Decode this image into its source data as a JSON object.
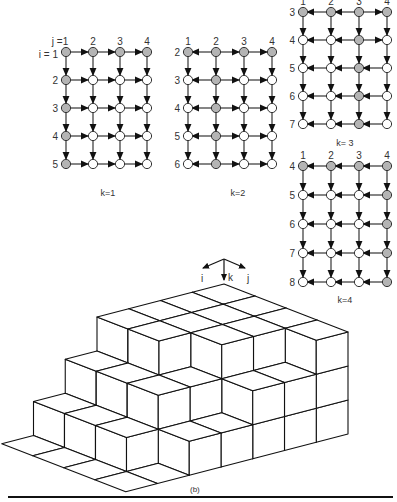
{
  "figure_label": "(b)",
  "axes_glyph": {
    "i_label": "i",
    "k_label": "k",
    "j_label": "j"
  },
  "colors": {
    "shaded_node": "#b4b4b4",
    "open_node": "#ffffff",
    "line": "#222222"
  },
  "grids": [
    {
      "id": "k1",
      "caption": "k=1",
      "x0": 66,
      "y0": 52,
      "dx": 27,
      "dy": 28,
      "col_labels": [
        "j =1",
        "2",
        "3",
        "4"
      ],
      "row_label_prefix": "i = ",
      "row_labels": [
        "1",
        "2",
        "3",
        "4",
        "5"
      ],
      "shaded": [
        [
          1,
          1,
          1,
          1
        ],
        [
          1,
          0,
          0,
          0
        ],
        [
          1,
          0,
          0,
          0
        ],
        [
          1,
          0,
          0,
          0
        ],
        [
          1,
          0,
          0,
          0
        ]
      ],
      "h_dirs": [
        [
          "R",
          "R",
          "R"
        ],
        [
          "R",
          "R",
          "R"
        ],
        [
          "R",
          "R",
          "R"
        ],
        [
          "R",
          "R",
          "R"
        ],
        [
          "R",
          "R",
          "R"
        ]
      ],
      "caption_xy": [
        108,
        196
      ]
    },
    {
      "id": "k2",
      "caption": "k=2",
      "x0": 188,
      "y0": 52,
      "dx": 28,
      "dy": 28,
      "col_labels": [
        "1",
        "2",
        "3",
        "4"
      ],
      "row_labels": [
        "2",
        "3",
        "4",
        "5",
        "6"
      ],
      "shaded": [
        [
          1,
          1,
          1,
          1
        ],
        [
          0,
          1,
          0,
          0
        ],
        [
          0,
          1,
          0,
          0
        ],
        [
          0,
          1,
          0,
          0
        ],
        [
          0,
          1,
          0,
          0
        ]
      ],
      "h_dirs": [
        [
          "L",
          "R",
          "R"
        ],
        [
          "L",
          "R",
          "R"
        ],
        [
          "L",
          "R",
          "R"
        ],
        [
          "L",
          "R",
          "R"
        ],
        [
          "L",
          "R",
          "R"
        ]
      ],
      "caption_xy": [
        238,
        196
      ]
    },
    {
      "id": "k3",
      "caption": "k= 3",
      "x0": 303,
      "y0": 12,
      "dx": 28,
      "dy": 28,
      "col_labels": [
        "1",
        "2",
        "3",
        "4"
      ],
      "row_labels": [
        "3",
        "4",
        "5",
        "6",
        "7"
      ],
      "shaded": [
        [
          1,
          1,
          1,
          1
        ],
        [
          0,
          0,
          1,
          0
        ],
        [
          0,
          0,
          1,
          0
        ],
        [
          0,
          0,
          1,
          0
        ],
        [
          0,
          0,
          1,
          0
        ]
      ],
      "h_dirs": [
        [
          "L",
          "L",
          "R"
        ],
        [
          "L",
          "L",
          "R"
        ],
        [
          "L",
          "L",
          "L"
        ],
        [
          "L",
          "L",
          "L"
        ],
        [
          "L",
          "L",
          "L"
        ]
      ],
      "caption_xy": [
        345,
        146
      ]
    },
    {
      "id": "k4",
      "caption": "k=4",
      "x0": 303,
      "y0": 166,
      "dx": 28,
      "dy": 29,
      "col_labels": [
        "1",
        "2",
        "3",
        "4"
      ],
      "row_labels": [
        "4",
        "5",
        "6",
        "7",
        "8"
      ],
      "shaded": [
        [
          1,
          1,
          1,
          1
        ],
        [
          0,
          0,
          0,
          1
        ],
        [
          0,
          0,
          0,
          1
        ],
        [
          0,
          0,
          0,
          1
        ],
        [
          0,
          0,
          0,
          1
        ]
      ],
      "h_dirs": [
        [
          "L",
          "L",
          "L"
        ],
        [
          "L",
          "L",
          "L"
        ],
        [
          "L",
          "L",
          "L"
        ],
        [
          "L",
          "L",
          "L"
        ],
        [
          "L",
          "L",
          "L"
        ]
      ],
      "caption_xy": [
        345,
        303
      ]
    }
  ],
  "staircase": {
    "origin": [
      224,
      284
    ],
    "a": [
      -31.75,
      8.25
    ],
    "b": [
      31,
      12
    ],
    "h": 34,
    "top_level": 3,
    "heights": [
      [
        3,
        3,
        3,
        3
      ],
      [
        3,
        3,
        3,
        2
      ],
      [
        3,
        3,
        3,
        2
      ],
      [
        3,
        3,
        2,
        1
      ],
      [
        2,
        2,
        2,
        1
      ],
      [
        1,
        1,
        1,
        0
      ],
      [
        0,
        0,
        0,
        0
      ]
    ]
  }
}
